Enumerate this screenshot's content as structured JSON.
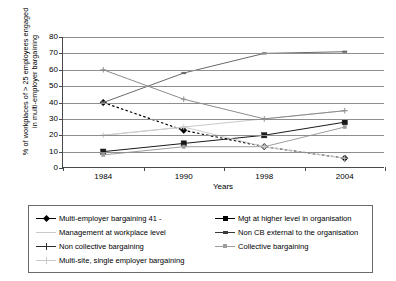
{
  "chart_data": {
    "type": "line",
    "title": "",
    "xlabel": "Years",
    "ylabel": "% of workplaces of > 25 employees engaged in multi-employer bargaining",
    "ylabel_line1": "% of workplaces of > 25 employees engaged",
    "ylabel_line2": "in multi-employer bargaining",
    "categories": [
      "1984",
      "1990",
      "1998",
      "2004"
    ],
    "x": [
      1984,
      1990,
      1998,
      2004
    ],
    "ylim": [
      0,
      80
    ],
    "yticks": [
      0,
      10,
      20,
      30,
      40,
      50,
      60,
      70,
      80
    ],
    "grid": true,
    "legend_position": "bottom",
    "series": [
      {
        "name": "Multi-employer bargaining 41 -",
        "values": [
          40,
          23,
          13,
          6
        ],
        "color": "#000000",
        "marker": "diamond",
        "dash": "dotted"
      },
      {
        "name": "Mgt at higher level in organisation",
        "values": [
          10,
          15,
          20,
          28
        ],
        "color": "#1a1a1a",
        "marker": "square",
        "dash": "solid"
      },
      {
        "name": "Management at workplace level",
        "values": [
          20,
          25,
          30,
          35
        ],
        "color": "#c9c9c9",
        "marker": "line",
        "dash": "solid"
      },
      {
        "name": "Non CB external to the organisation",
        "values": [
          40,
          58,
          70,
          71
        ],
        "color": "#6a6a6a",
        "marker": "dash",
        "dash": "solid"
      },
      {
        "name": "Non collective bargaining",
        "values": [
          60,
          42,
          30,
          35
        ],
        "color": "#8c8c8c",
        "marker": "plus",
        "dash": "solid"
      },
      {
        "name": "Collective bargaining",
        "values": [
          8,
          13,
          13,
          25
        ],
        "color": "#9e9e9e",
        "marker": "smallsquare",
        "dash": "solid"
      },
      {
        "name": "Multi-site, single employer bargaining",
        "values": [
          20,
          25,
          13,
          6
        ],
        "color": "#cccccc",
        "marker": "plus",
        "dash": "solid"
      }
    ]
  },
  "legend": {
    "left_column": [
      {
        "label": "Multi-employer bargaining 41 -",
        "marker": "diamond",
        "color": "#000000"
      },
      {
        "label": "Management at workplace level",
        "marker": "line",
        "color": "#c9c9c9"
      },
      {
        "label": "Non collective bargaining",
        "marker": "plus",
        "color": "#2b2b2b"
      },
      {
        "label": "Multi-site, single employer bargaining",
        "marker": "plus",
        "color": "#c9c9c9"
      }
    ],
    "right_column": [
      {
        "label": "Mgt at higher level in organisation",
        "marker": "square",
        "color": "#000000"
      },
      {
        "label": "Non CB external to the organisation",
        "marker": "dash",
        "color": "#3a3a3a"
      },
      {
        "label": "Collective bargaining",
        "marker": "smallsquare",
        "color": "#9e9e9e"
      }
    ]
  }
}
